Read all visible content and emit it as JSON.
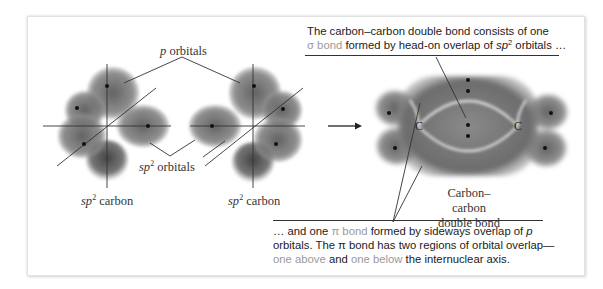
{
  "figure": {
    "labels": {
      "p_orbitals": {
        "italic": "p",
        "text": " orbitals"
      },
      "sp2_orbitals": {
        "italic": "sp",
        "sup": "2",
        "text": " orbitals"
      },
      "sp2_carbon_left": {
        "italic": "sp",
        "sup": "2",
        "text": " carbon"
      },
      "sp2_carbon_right": {
        "italic": "sp",
        "sup": "2",
        "text": " carbon"
      },
      "double_bond_line1": "Carbon–carbon",
      "double_bond_line2": "double bond",
      "atom_left": "C",
      "atom_right": "C"
    },
    "caption_top": {
      "line1": "The carbon–carbon double bond consists of one",
      "line2_highlight": "σ bond",
      "line2_rest_a": " formed by head-on overlap of ",
      "line2_italic": "sp",
      "line2_sup": "2",
      "line2_rest_b": " orbitals …"
    },
    "caption_bottom": {
      "line1_a": "… and one ",
      "line1_highlight": "π bond",
      "line1_b": " formed by sideways overlap of ",
      "line1_italic": "p",
      "line2": "orbitals. The π bond has two regions of orbital overlap—",
      "line3_hl1": "one above",
      "line3_mid": " and ",
      "line3_hl2": "one below",
      "line3_end": " the internuclear axis."
    },
    "colors": {
      "highlight_text": "#9a9a9a",
      "orbital_fill": "#6e6e6e",
      "text": "#222222"
    }
  }
}
